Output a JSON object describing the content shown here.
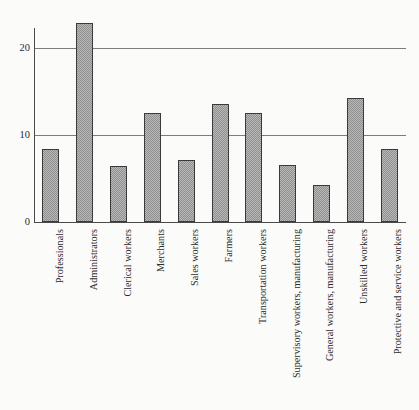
{
  "chart_data": {
    "type": "bar",
    "title": "",
    "subtitle": "",
    "xlabel": "",
    "ylabel": "",
    "ylim": [
      0,
      24
    ],
    "yticks": [
      0,
      10,
      20
    ],
    "ytick_labels": [
      "0",
      "10",
      "20"
    ],
    "grid": "horizontal gridlines at y=10 and y=20",
    "legend": "none",
    "orientation": "vertical",
    "bar_style": "gray crosshatch/dither fill with dark outline",
    "categories": [
      "Professionals",
      "Administrators",
      "Clerical workers",
      "Merchants",
      "Sales workers",
      "Farmers",
      "Transportation workers",
      "Supervisory workers, manufacturing",
      "General workers, manufacturing",
      "Unskilled workers",
      "Protective and service workers"
    ],
    "values": [
      8.4,
      22.9,
      6.4,
      12.5,
      7.1,
      13.6,
      12.5,
      6.6,
      4.3,
      14.2,
      8.4
    ],
    "label_rotation": -90
  },
  "colors": {
    "background": "#fbfbfa",
    "bar_fill": "#b9b9b9",
    "bar_edge": "#3a3a3a",
    "gridline": "#7c7c7c",
    "axis": "#4a4a4a",
    "text": "#2b2b2b"
  }
}
